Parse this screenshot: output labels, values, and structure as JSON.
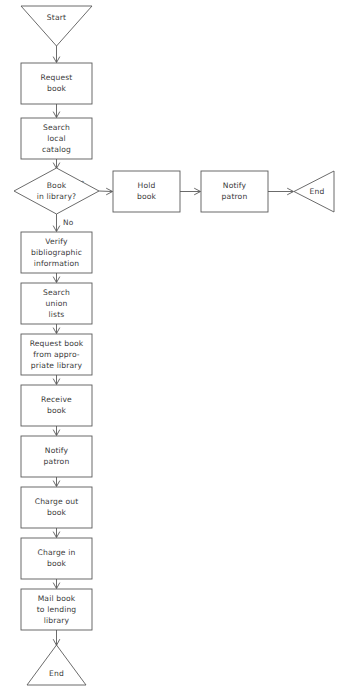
{
  "diagram": {
    "orientation": "top-to-bottom with right branch",
    "colors": {
      "background": "#ffffff",
      "stroke": "#5a5a5a",
      "text": "#3a3a3a"
    },
    "nodes": [
      {
        "id": "start",
        "shape": "triangle-down",
        "label": "Start",
        "lines": [
          "Start"
        ],
        "x": 21,
        "y": 6,
        "w": 71,
        "h": 40
      },
      {
        "id": "request-book",
        "shape": "rect",
        "label": "Request book",
        "lines": [
          "Request",
          "book"
        ],
        "x": 21,
        "y": 63,
        "w": 71,
        "h": 41
      },
      {
        "id": "search-local-catalog",
        "shape": "rect",
        "label": "Search local catalog",
        "lines": [
          "Search",
          "local",
          "catalog"
        ],
        "x": 21,
        "y": 118,
        "w": 71,
        "h": 41
      },
      {
        "id": "book-in-library",
        "shape": "diamond",
        "label": "Book in library?",
        "lines": [
          "Book",
          "in library?"
        ],
        "x": 14,
        "y": 168,
        "w": 85,
        "h": 46
      },
      {
        "id": "verify-bibliographic",
        "shape": "rect",
        "label": "Verify bibliographic information",
        "lines": [
          "Verify",
          "bibliographic",
          "information"
        ],
        "x": 21,
        "y": 232,
        "w": 71,
        "h": 41
      },
      {
        "id": "search-union-lists",
        "shape": "rect",
        "label": "Search union lists",
        "lines": [
          "Search",
          "union",
          "lists"
        ],
        "x": 21,
        "y": 283,
        "w": 71,
        "h": 41
      },
      {
        "id": "request-from-library",
        "shape": "rect",
        "label": "Request book from appropriate library",
        "lines": [
          "Request book",
          "from appro-",
          "priate library"
        ],
        "x": 21,
        "y": 334,
        "w": 71,
        "h": 41
      },
      {
        "id": "receive-book",
        "shape": "rect",
        "label": "Receive book",
        "lines": [
          "Receive",
          "book"
        ],
        "x": 21,
        "y": 385,
        "w": 71,
        "h": 41
      },
      {
        "id": "notify-patron-loan",
        "shape": "rect",
        "label": "Notify patron",
        "lines": [
          "Notify",
          "patron"
        ],
        "x": 21,
        "y": 436,
        "w": 71,
        "h": 41
      },
      {
        "id": "charge-out-book",
        "shape": "rect",
        "label": "Charge out book",
        "lines": [
          "Charge out",
          "book"
        ],
        "x": 21,
        "y": 487,
        "w": 71,
        "h": 41
      },
      {
        "id": "charge-in-book",
        "shape": "rect",
        "label": "Charge in book",
        "lines": [
          "Charge in",
          "book"
        ],
        "x": 21,
        "y": 538,
        "w": 71,
        "h": 41
      },
      {
        "id": "mail-book",
        "shape": "rect",
        "label": "Mail book to lending library",
        "lines": [
          "Mail book",
          "to lending",
          "library"
        ],
        "x": 21,
        "y": 589,
        "w": 71,
        "h": 41
      },
      {
        "id": "end-bottom",
        "shape": "triangle-up",
        "label": "End",
        "lines": [
          "End"
        ],
        "x": 27,
        "y": 645,
        "w": 59,
        "h": 40
      },
      {
        "id": "hold-book",
        "shape": "rect",
        "label": "Hold book",
        "lines": [
          "Hold",
          "book"
        ],
        "x": 113,
        "y": 171,
        "w": 67,
        "h": 41
      },
      {
        "id": "notify-patron-hold",
        "shape": "rect",
        "label": "Notify patron",
        "lines": [
          "Notify",
          "patron"
        ],
        "x": 201,
        "y": 171,
        "w": 67,
        "h": 41
      },
      {
        "id": "end-right",
        "shape": "triangle-left",
        "label": "End",
        "lines": [
          "End"
        ],
        "x": 294,
        "y": 171,
        "w": 40,
        "h": 41
      }
    ],
    "edges": [
      {
        "id": "e-start-request",
        "from": "start",
        "to": "request-book",
        "label": ""
      },
      {
        "id": "e-request-search",
        "from": "request-book",
        "to": "search-local-catalog",
        "label": ""
      },
      {
        "id": "e-search-decision",
        "from": "search-local-catalog",
        "to": "book-in-library",
        "label": ""
      },
      {
        "id": "e-decision-hold",
        "from": "book-in-library",
        "to": "hold-book",
        "label": "Yes"
      },
      {
        "id": "e-decision-verify",
        "from": "book-in-library",
        "to": "verify-bibliographic",
        "label": "No"
      },
      {
        "id": "e-hold-notify",
        "from": "hold-book",
        "to": "notify-patron-hold",
        "label": ""
      },
      {
        "id": "e-notify-end",
        "from": "notify-patron-hold",
        "to": "end-right",
        "label": ""
      },
      {
        "id": "e-verify-union",
        "from": "verify-bibliographic",
        "to": "search-union-lists",
        "label": ""
      },
      {
        "id": "e-union-request",
        "from": "search-union-lists",
        "to": "request-from-library",
        "label": ""
      },
      {
        "id": "e-request-receive",
        "from": "request-from-library",
        "to": "receive-book",
        "label": ""
      },
      {
        "id": "e-receive-notify",
        "from": "receive-book",
        "to": "notify-patron-loan",
        "label": ""
      },
      {
        "id": "e-notify-chargeout",
        "from": "notify-patron-loan",
        "to": "charge-out-book",
        "label": ""
      },
      {
        "id": "e-chargeout-chargein",
        "from": "charge-out-book",
        "to": "charge-in-book",
        "label": ""
      },
      {
        "id": "e-chargein-mail",
        "from": "charge-in-book",
        "to": "mail-book",
        "label": ""
      },
      {
        "id": "e-mail-end",
        "from": "mail-book",
        "to": "end-bottom",
        "label": ""
      }
    ],
    "edge_labels": {
      "yes": "Yes",
      "no": "No"
    }
  }
}
